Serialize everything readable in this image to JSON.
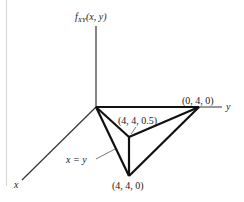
{
  "figure": {
    "z_axis_label_f": "f",
    "z_axis_label_sub": "XY",
    "z_axis_label_args": "(x, y)",
    "x_axis_label": "x",
    "y_axis_label": "y",
    "annotation_line": "x = y",
    "vertices": [
      {
        "label": "(0, 4, 0)",
        "coords": [
          0,
          4,
          0
        ]
      },
      {
        "label": "(4, 4, 0.5)",
        "coords": [
          4,
          4,
          0.5
        ]
      },
      {
        "label": "(4, 4, 0)",
        "coords": [
          4,
          4,
          0
        ]
      }
    ],
    "colors": {
      "axis": "#333333",
      "edge": "#111111",
      "leader": "#555555",
      "rule": "#d4d4d4"
    }
  }
}
